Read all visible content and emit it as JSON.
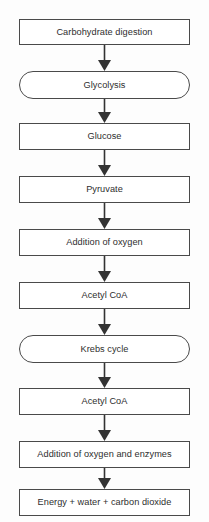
{
  "diagram": {
    "orientation": "vertical-top-to-bottom",
    "background_color": "#fdfdfd",
    "line_color": "#4a4a4a",
    "text_color": "#2e2e2e",
    "arrow_color": "#333333",
    "nodes": [
      {
        "id": "carbohydrate-digestion",
        "label": "Carbohydrate digestion",
        "shape": "rect",
        "top": 19,
        "height": 26
      },
      {
        "id": "glycolysis",
        "label": "Glycolysis",
        "shape": "stadium",
        "top": 71,
        "height": 28
      },
      {
        "id": "glucose",
        "label": "Glucose",
        "shape": "rect",
        "top": 123,
        "height": 27
      },
      {
        "id": "pyruvate",
        "label": "Pyruvate",
        "shape": "rect",
        "top": 176,
        "height": 27
      },
      {
        "id": "addition-of-oxygen",
        "label": "Addition of oxygen",
        "shape": "rect",
        "top": 229,
        "height": 27
      },
      {
        "id": "acetyl-coa-1",
        "label": "Acetyl CoA",
        "shape": "rect",
        "top": 282,
        "height": 27
      },
      {
        "id": "krebs-cycle",
        "label": "Krebs cycle",
        "shape": "stadium",
        "top": 335,
        "height": 28
      },
      {
        "id": "acetyl-coa-2",
        "label": "Acetyl CoA",
        "shape": "rect",
        "top": 388,
        "height": 27
      },
      {
        "id": "addition-of-oxygen-and-enzymes",
        "label": "Addition of oxygen and enzymes",
        "shape": "rect",
        "top": 441,
        "height": 27
      },
      {
        "id": "energy-water-carbon-dioxide",
        "label": "Energy + water + carbon dioxide",
        "shape": "rect",
        "top": 489,
        "height": 27
      }
    ],
    "arrows": [
      {
        "id": "arrow-1",
        "from": "carbohydrate-digestion",
        "to": "glycolysis",
        "icon": "down-arrow-icon",
        "top": 45,
        "height": 26
      },
      {
        "id": "arrow-2",
        "from": "glycolysis",
        "to": "glucose",
        "icon": "down-arrow-icon",
        "top": 99,
        "height": 24
      },
      {
        "id": "arrow-3",
        "from": "glucose",
        "to": "pyruvate",
        "icon": "down-arrow-icon",
        "top": 150,
        "height": 26
      },
      {
        "id": "arrow-4",
        "from": "pyruvate",
        "to": "addition-of-oxygen",
        "icon": "down-arrow-icon",
        "top": 203,
        "height": 26
      },
      {
        "id": "arrow-5",
        "from": "addition-of-oxygen",
        "to": "acetyl-coa-1",
        "icon": "down-arrow-icon",
        "top": 256,
        "height": 26
      },
      {
        "id": "arrow-6",
        "from": "acetyl-coa-1",
        "to": "krebs-cycle",
        "icon": "down-arrow-icon",
        "top": 309,
        "height": 26
      },
      {
        "id": "arrow-7",
        "from": "krebs-cycle",
        "to": "acetyl-coa-2",
        "icon": "down-arrow-icon",
        "top": 363,
        "height": 25
      },
      {
        "id": "arrow-8",
        "from": "acetyl-coa-2",
        "to": "addition-of-oxygen-and-enzymes",
        "icon": "down-arrow-icon",
        "top": 415,
        "height": 26
      },
      {
        "id": "arrow-9",
        "from": "addition-of-oxygen-and-enzymes",
        "to": "energy-water-carbon-dioxide",
        "icon": "down-arrow-icon",
        "top": 468,
        "height": 21
      }
    ]
  }
}
